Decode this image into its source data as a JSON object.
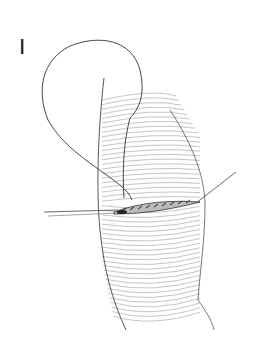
{
  "figure": {
    "panel_label": "I",
    "colors": {
      "line": "#333333",
      "hatch": "#777777",
      "background": "#ffffff"
    }
  }
}
